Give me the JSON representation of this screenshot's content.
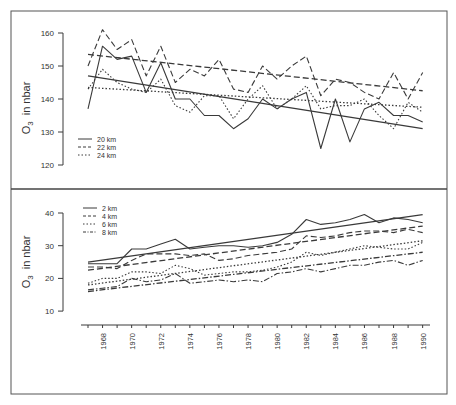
{
  "chart_data": [
    {
      "type": "line",
      "panel": "top",
      "title": "",
      "xlabel": "",
      "ylabel": "O3  in nbar",
      "ylabel_main": "O",
      "ylabel_sub": "3",
      "ylabel_rest": "in nbar",
      "ylim": [
        120,
        160
      ],
      "yticks": [
        120,
        130,
        140,
        150,
        160
      ],
      "grid": false,
      "legend_position": "lower-left",
      "x": [
        1967,
        1968,
        1969,
        1970,
        1971,
        1972,
        1973,
        1974,
        1975,
        1976,
        1977,
        1978,
        1979,
        1980,
        1981,
        1982,
        1983,
        1984,
        1985,
        1986,
        1987,
        1988,
        1989,
        1990
      ],
      "series": [
        {
          "name": "20 km",
          "style": "solid",
          "values": [
            137,
            156,
            152,
            153,
            142,
            151,
            140,
            140,
            135,
            135,
            131,
            134,
            140,
            137,
            140,
            142,
            125,
            140,
            127,
            137,
            139,
            135,
            135,
            133
          ],
          "trend": [
            147,
            131
          ]
        },
        {
          "name": "22 km",
          "style": "dashed",
          "values": [
            150,
            161,
            155,
            158,
            147,
            156,
            145,
            149,
            147,
            152,
            143,
            142,
            150,
            146,
            150,
            153,
            141,
            146,
            145,
            142,
            140,
            148,
            140,
            148
          ],
          "trend": [
            153.5,
            142.5
          ]
        },
        {
          "name": "24 km",
          "style": "dotted",
          "values": [
            143,
            149,
            145,
            143,
            142,
            146,
            138,
            136,
            141,
            141,
            134,
            140,
            144,
            137,
            140,
            144,
            137,
            138,
            138,
            140,
            135,
            131,
            139,
            136
          ],
          "trend": [
            143.5,
            137.5
          ]
        }
      ]
    },
    {
      "type": "line",
      "panel": "bottom",
      "title": "",
      "xlabel": "",
      "ylabel": "O3  in nbar",
      "ylabel_main": "O",
      "ylabel_sub": "3",
      "ylabel_rest": "in nbar",
      "ylim": [
        10,
        40
      ],
      "yticks": [
        10,
        20,
        30,
        40
      ],
      "xticks": [
        1968,
        1970,
        1972,
        1974,
        1976,
        1978,
        1980,
        1982,
        1984,
        1986,
        1988,
        1990
      ],
      "grid": false,
      "legend_position": "upper-left",
      "x": [
        1967,
        1968,
        1969,
        1970,
        1971,
        1972,
        1973,
        1974,
        1975,
        1976,
        1977,
        1978,
        1979,
        1980,
        1981,
        1982,
        1983,
        1984,
        1985,
        1986,
        1987,
        1988,
        1989,
        1990
      ],
      "series": [
        {
          "name": "2 km",
          "style": "solid",
          "values": [
            24.5,
            24.5,
            24.5,
            29,
            29,
            30.5,
            32,
            29,
            29.5,
            30,
            30,
            29.5,
            30,
            31,
            33.5,
            38,
            36.5,
            37,
            38,
            39.5,
            37,
            38.5,
            38,
            37
          ],
          "trend": [
            25,
            39.5
          ]
        },
        {
          "name": "4 km",
          "style": "dashed",
          "values": [
            23.5,
            23.5,
            23,
            25.5,
            27.5,
            27.5,
            27.5,
            27,
            27.5,
            25.5,
            26,
            27,
            27.5,
            28,
            29,
            33,
            32.5,
            33,
            34,
            34.5,
            34.5,
            34,
            35,
            34
          ],
          "trend": [
            22.5,
            36
          ]
        },
        {
          "name": "6 km",
          "style": "dotted",
          "values": [
            18.5,
            20,
            20,
            22,
            22,
            21.5,
            24,
            23,
            21,
            21.5,
            22,
            22,
            22.5,
            23.5,
            25,
            28,
            27,
            28,
            29,
            30,
            29.5,
            29,
            29,
            31
          ],
          "trend": [
            18,
            31.5
          ]
        },
        {
          "name": "8 km",
          "style": "dashdot",
          "values": [
            16.5,
            17,
            17.5,
            20,
            19,
            19.5,
            21.5,
            18.5,
            19,
            19.5,
            19,
            19.5,
            19,
            21.5,
            22,
            23,
            22,
            23,
            24,
            24,
            25,
            25.5,
            24,
            25.5
          ],
          "trend": [
            16,
            28
          ]
        }
      ]
    }
  ],
  "layout": {
    "x_px_origin_year": 1967,
    "x_px_origin": 88,
    "x_px_per_year": 14.55,
    "top_panel": {
      "y_at_160": 33,
      "px_per_unit": 3.3
    },
    "bottom_panel": {
      "y_at_40": 213,
      "px_per_unit": 3.27
    }
  },
  "ink_color": "#3a3a3a"
}
